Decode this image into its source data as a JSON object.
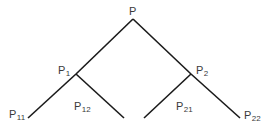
{
  "diagram": {
    "type": "binary-tree",
    "line_color": "#1a1a1a",
    "text_color": "#3a3a3a",
    "nodes": {
      "root": {
        "label": "P",
        "sub": ""
      },
      "p1": {
        "label": "P",
        "sub": "1"
      },
      "p2": {
        "label": "P",
        "sub": "2"
      },
      "p11": {
        "label": "P",
        "sub": "11"
      },
      "p12": {
        "label": "P",
        "sub": "12"
      },
      "p21": {
        "label": "P",
        "sub": "21"
      },
      "p22": {
        "label": "P",
        "sub": "22"
      }
    },
    "edges": [
      {
        "from": "root",
        "to": "p1"
      },
      {
        "from": "root",
        "to": "p2"
      },
      {
        "from": "p1",
        "to": "p11"
      },
      {
        "from": "p1",
        "to": "p12"
      },
      {
        "from": "p2",
        "to": "p21"
      },
      {
        "from": "p2",
        "to": "p22"
      }
    ]
  }
}
